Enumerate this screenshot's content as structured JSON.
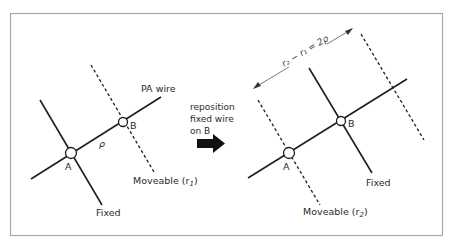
{
  "figure": {
    "type": "wire-repositioning-diagram",
    "colors": {
      "frame": "#a8a8a8",
      "line": "#1e1e1e",
      "text": "#2a2a2a",
      "background": "#ffffff"
    }
  },
  "left_panel": {
    "pa_wire_label": "PA wire",
    "node_a_label": "A",
    "node_b_label": "B",
    "spacing_label": "ρ",
    "moveable_label": "Moveable (r",
    "moveable_sub": "1",
    "moveable_close": ")",
    "fixed_label": "Fixed"
  },
  "transition": {
    "line1": "reposition",
    "line2": "fixed wire",
    "line3": "on B",
    "arrow_icon": "right-arrow"
  },
  "right_panel": {
    "dimension_label": "r₂ − r₁ = 2ρ",
    "node_a_label": "A",
    "node_b_label": "B",
    "fixed_label": "Fixed",
    "moveable_label": "Moveable (r",
    "moveable_sub": "2",
    "moveable_close": ")"
  }
}
